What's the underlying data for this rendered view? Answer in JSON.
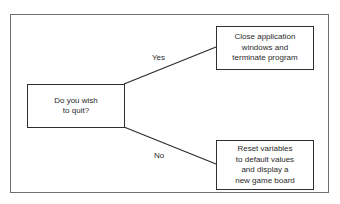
{
  "diagram": {
    "type": "decision-flowchart",
    "decision": {
      "lines": [
        "Do you wish",
        "to quit?"
      ]
    },
    "branches": [
      {
        "label": "Yes",
        "result_lines": [
          "Close application",
          "windows and",
          "terminate program"
        ]
      },
      {
        "label": "No",
        "result_lines": [
          "Reset variables",
          "to default values",
          "and display a",
          "new game board"
        ]
      }
    ],
    "colors": {
      "stroke": "#2e2e2e",
      "frame": "#6e6e6e",
      "background": "#ffffff"
    }
  }
}
